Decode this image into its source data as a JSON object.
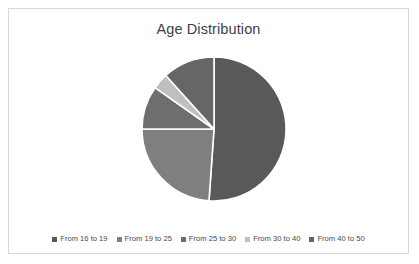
{
  "chart_data": {
    "type": "pie",
    "title": "Age Distribution",
    "xlabel": "",
    "ylabel": "",
    "legend_position": "bottom",
    "grid": false,
    "start_angle_deg": 0,
    "direction": "clockwise",
    "categories": [
      "From 16 to 19",
      "From 19 to 25",
      "From 25 to 30",
      "From 30 to 40",
      "From 40 to 50"
    ],
    "values": [
      51.1,
      23.9,
      9.7,
      3.6,
      11.7
    ],
    "slices": [
      {
        "label": "From 16 to 19",
        "value": 51.1,
        "start_deg": 0,
        "end_deg": 184,
        "color": "#595959"
      },
      {
        "label": "From 19 to 25",
        "value": 23.9,
        "start_deg": 184,
        "end_deg": 270,
        "color": "#7f7f7f"
      },
      {
        "label": "From 25 to 30",
        "value": 9.7,
        "start_deg": 270,
        "end_deg": 305,
        "color": "#6e6e6e"
      },
      {
        "label": "From 30 to 40",
        "value": 3.6,
        "start_deg": 305,
        "end_deg": 318,
        "color": "#bfbfbf"
      },
      {
        "label": "From 40 to 50",
        "value": 11.7,
        "start_deg": 318,
        "end_deg": 360,
        "color": "#666666"
      }
    ],
    "geometry": {
      "center_x": 205,
      "center_y": 92,
      "radius": 72
    },
    "style": {
      "background": "#ffffff",
      "border_color": "#d8d8d8",
      "title_color": "#3f3f3f",
      "legend_text_color": "#4a4a4a",
      "slice_separator_color": "#ffffff"
    }
  }
}
